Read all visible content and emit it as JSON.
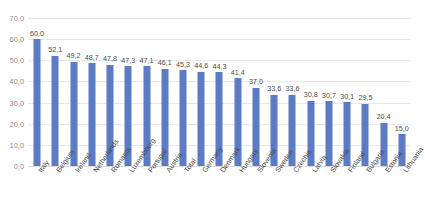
{
  "chart_data": {
    "type": "bar",
    "title": "",
    "xlabel": "",
    "ylabel": "",
    "ylim": [
      0,
      70
    ],
    "ytick_labels": [
      "70,0",
      "60,0",
      "50,0",
      "40,0",
      "30,0",
      "20,0",
      "10,0",
      "0,0"
    ],
    "ytick_values": [
      70,
      60,
      50,
      40,
      30,
      20,
      10,
      0
    ],
    "grid": true,
    "legend": "none",
    "decimal_separator": ",",
    "bar_color": "#5b7bc4",
    "gridline_color": "#e8e8ec",
    "categories": [
      "Italy",
      "Belgium",
      "Ireland",
      "Netherlands",
      "Romania",
      "Luxembourg",
      "Portugal",
      "Austria",
      "Total",
      "Germany",
      "Denmark",
      "Hungary",
      "Slovenia",
      "Sweden",
      "Czechia",
      "Latvia",
      "Slovakia",
      "Finland",
      "Bulgaria",
      "Estonia",
      "Lithuania"
    ],
    "values": [
      60.0,
      52.1,
      49.2,
      48.7,
      47.8,
      47.3,
      47.1,
      46.1,
      45.3,
      44.6,
      44.3,
      41.4,
      37.0,
      33.6,
      33.6,
      30.8,
      30.7,
      30.1,
      29.5,
      20.4,
      15.0
    ],
    "value_labels": [
      "60,0",
      "52,1",
      "49,2",
      "48,7",
      "47,8",
      "47,3",
      "47,1",
      "46,1",
      "45,3",
      "44,6",
      "44,3",
      "41,4",
      "37,0",
      "33,6",
      "33,6",
      "30,8",
      "30,7",
      "30,1",
      "29,5",
      "20,4",
      "15,0"
    ]
  }
}
